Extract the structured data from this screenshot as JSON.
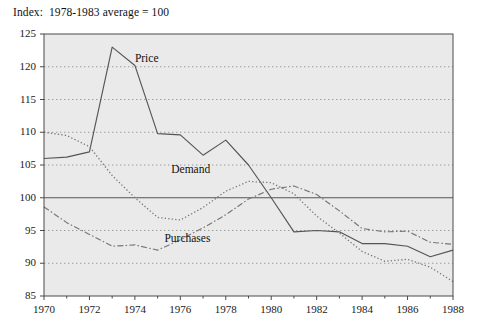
{
  "chart_data": {
    "type": "line",
    "title": "Index:  1978-1983 average = 100",
    "xlabel": "",
    "ylabel": "",
    "xlim": [
      1970,
      1988
    ],
    "ylim": [
      85,
      125
    ],
    "xticks": [
      1970,
      1972,
      1974,
      1976,
      1978,
      1980,
      1982,
      1984,
      1986,
      1988
    ],
    "yticks": [
      85,
      90,
      95,
      100,
      105,
      110,
      115,
      120,
      125
    ],
    "grid": "horizontal-dotted",
    "legend_position": "inline-annotations",
    "reference_line": 100,
    "x": [
      1970,
      1971,
      1972,
      1973,
      1974,
      1975,
      1976,
      1977,
      1978,
      1979,
      1980,
      1981,
      1982,
      1983,
      1984,
      1985,
      1986,
      1987,
      1988
    ],
    "series": [
      {
        "name": "Price",
        "style": "solid",
        "values": [
          106.0,
          106.2,
          107.0,
          123.0,
          120.2,
          109.8,
          109.6,
          106.5,
          108.8,
          105.0,
          100.0,
          94.8,
          95.0,
          94.8,
          93.0,
          93.0,
          92.6,
          91.0,
          92.0
        ]
      },
      {
        "name": "Demand",
        "style": "dotted",
        "values": [
          110.0,
          109.5,
          107.8,
          103.4,
          100.0,
          97.0,
          96.6,
          98.5,
          101.0,
          102.5,
          102.3,
          100.6,
          97.2,
          94.6,
          91.8,
          90.3,
          90.6,
          89.4,
          87.2
        ]
      },
      {
        "name": "Purchases",
        "style": "dash-dot",
        "values": [
          98.6,
          96.2,
          94.4,
          92.6,
          92.8,
          92.0,
          93.6,
          95.4,
          97.4,
          99.8,
          101.3,
          101.8,
          100.5,
          98.0,
          95.3,
          94.8,
          94.9,
          93.2,
          92.9
        ]
      }
    ],
    "annotations": [
      {
        "text": "Price",
        "x": 1974.0,
        "y": 121.0
      },
      {
        "text": "Demand",
        "x": 1975.6,
        "y": 104.1
      },
      {
        "text": "Purchases",
        "x": 1975.3,
        "y": 93.5
      }
    ]
  },
  "colors": {
    "plot_background": "#eaeaea",
    "frame": "#4a4a4a",
    "gridline": "#9a9a9a",
    "reference_line": "#555555",
    "price_line": "#555555",
    "demand_line": "#777777",
    "purchases_line": "#777777",
    "text": "#1a1a1a"
  }
}
